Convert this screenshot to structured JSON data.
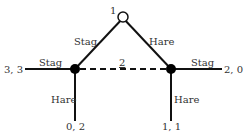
{
  "diagram": {
    "colors": {
      "line": "#111111",
      "text": "#333333",
      "node_fill": "#000000",
      "root_fill": "#ffffff"
    },
    "nodes": {
      "root": {
        "label": "1",
        "type": "open-circle"
      },
      "left": {
        "type": "filled-circle"
      },
      "right": {
        "type": "filled-circle"
      }
    },
    "info_set_label": "2",
    "edges": {
      "root_left": "Stag",
      "root_right": "Hare",
      "left_left": "Stag",
      "left_down": "Hare",
      "right_right": "Stag",
      "right_down": "Hare"
    },
    "payoffs": {
      "left_stag": "3, 3",
      "left_hare": "0, 2",
      "right_stag": "2, 0",
      "right_hare": "1, 1"
    }
  }
}
